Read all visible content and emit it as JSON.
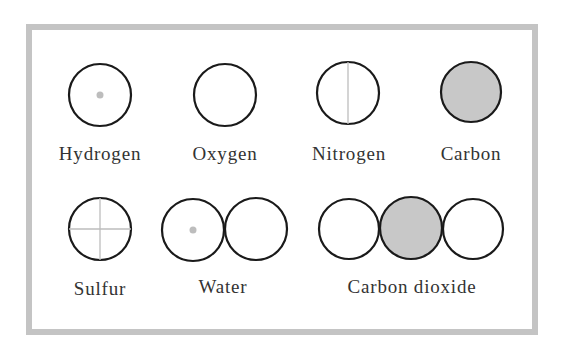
{
  "colors": {
    "outline": "#1a1a1a",
    "fill_carbon": "#c8c8c8",
    "marker": "#bdbdbd",
    "border": "#c4c4c4"
  },
  "items": [
    {
      "label": "Hydrogen",
      "symbol": "circle-with-center-dot"
    },
    {
      "label": "Oxygen",
      "symbol": "plain-circle"
    },
    {
      "label": "Nitrogen",
      "symbol": "circle-with-vertical-line"
    },
    {
      "label": "Carbon",
      "symbol": "shaded-circle"
    },
    {
      "label": "Sulfur",
      "symbol": "circle-with-cross"
    },
    {
      "label": "Water",
      "symbol": "hydrogen-oxygen-pair"
    },
    {
      "label": "Carbon dioxide",
      "symbol": "oxygen-carbon-oxygen-chain"
    }
  ]
}
